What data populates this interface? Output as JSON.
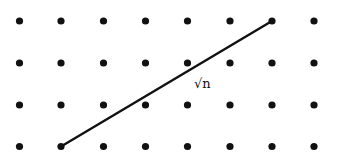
{
  "diagram": {
    "type": "lattice-grid-with-segment",
    "grid": {
      "columns": 8,
      "rows": 4,
      "x_positions": [
        19.5,
        61,
        103.5,
        145.5,
        187.5,
        230,
        272,
        314
      ],
      "y_positions": [
        21,
        63,
        105,
        146.5
      ],
      "dot_radius": 3.6,
      "dot_color": "#111111"
    },
    "segment": {
      "from": {
        "col": 1,
        "row": 3
      },
      "to": {
        "col": 6,
        "row": 0
      },
      "color": "#111111",
      "width": 2.4
    },
    "label": {
      "text": "√n",
      "x": 194,
      "y": 77
    },
    "background": "#ffffff"
  }
}
